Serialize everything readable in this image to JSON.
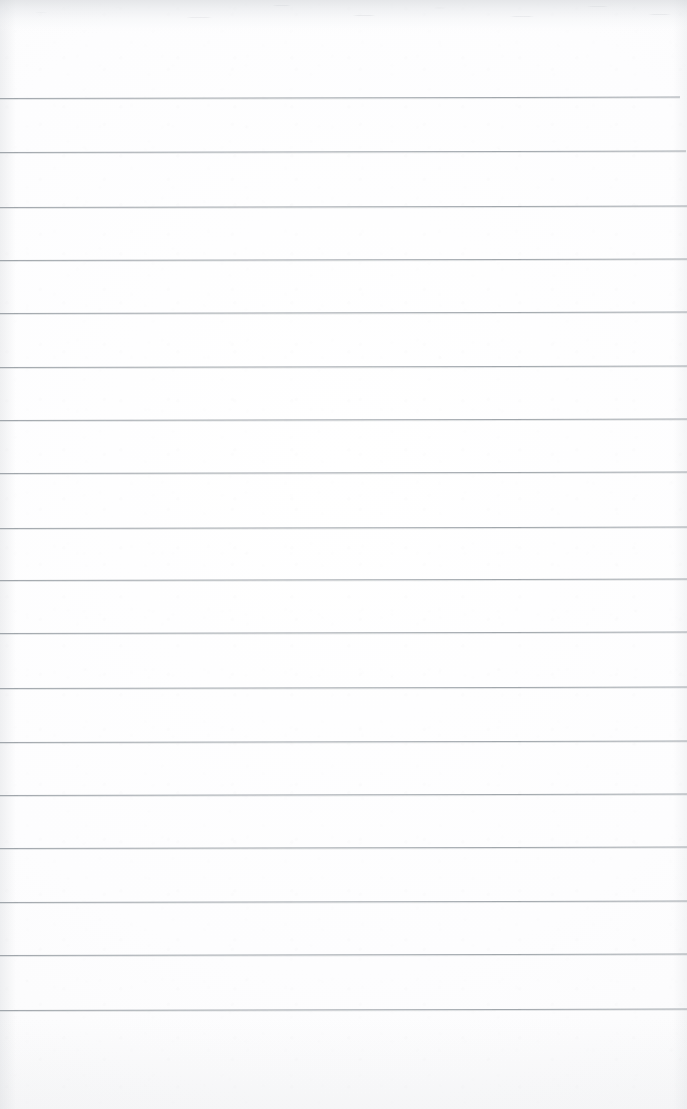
{
  "document": {
    "kind": "scanned-lined-paper",
    "title": "Blank ruled notebook page",
    "description": "A scanned sheet of blank ruled writing paper with no handwriting or printed text.",
    "page_width": 687,
    "page_height": 1109,
    "orientation": "portrait",
    "has_text": false,
    "has_handwriting": false,
    "text_content": ""
  },
  "colors": {
    "paper": "#fdfdfd",
    "paper_edge_shadow": "#d0d3d7",
    "rule_line": "#9aa0a6",
    "top_scan_band": "#cdd0d4"
  },
  "ruling": {
    "style": "wide-ruled horizontal lines",
    "line_count": 18,
    "line_thickness_px": 1,
    "average_spacing_px": 53.6,
    "first_line_y": 98,
    "last_line_y": 1010,
    "left_inset_px": 0,
    "right_inset_px": 0,
    "tilt_degrees": -0.12,
    "margin_rule_present": false,
    "holes_present": false,
    "top_margin_px": 98,
    "bottom_margin_px": 99,
    "line_y_positions": [
      98,
      152,
      207,
      260,
      313,
      367,
      420,
      473,
      528,
      580,
      633,
      688,
      742,
      795,
      848,
      902,
      955,
      1010
    ],
    "line_right_ends": [
      680,
      686,
      687,
      687,
      687,
      687,
      687,
      687,
      687,
      687,
      687,
      687,
      687,
      687,
      687,
      687,
      687,
      687
    ]
  },
  "scan_artifacts": {
    "top_band_height_px": 34,
    "top_band_note": "mottled gray scanner-edge shading across top of sheet",
    "vignette": true,
    "paper_grain": true
  }
}
